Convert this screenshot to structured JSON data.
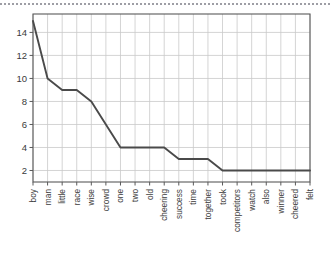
{
  "chart_data": {
    "type": "line",
    "title": "",
    "subtitle": "",
    "xlabel": "",
    "ylabel": "",
    "categories": [
      "boy",
      "man",
      "little",
      "race",
      "wise",
      "crowd",
      "one",
      "two",
      "old",
      "cheering",
      "success",
      "time",
      "together",
      "took",
      "competitors",
      "watch",
      "also",
      "winner",
      "cheered",
      "felt"
    ],
    "values": [
      15,
      10,
      9,
      9,
      8,
      6,
      4,
      4,
      4,
      4,
      3,
      3,
      3,
      2,
      2,
      2,
      2,
      2,
      2,
      2
    ],
    "series": [
      {
        "name": "word frequency",
        "values": [
          15,
          10,
          9,
          9,
          8,
          6,
          4,
          4,
          4,
          4,
          3,
          3,
          3,
          2,
          2,
          2,
          2,
          2,
          2,
          2
        ]
      }
    ],
    "ylim": [
      1,
      15.6
    ],
    "xlim": [
      0,
      19
    ],
    "yticks": [
      2,
      4,
      6,
      8,
      10,
      12,
      14
    ],
    "ytick_labels": [
      "2",
      "4",
      "6",
      "8",
      "10",
      "12",
      "14"
    ],
    "grid": true,
    "grid_axes": "both",
    "legend": "none",
    "annotations": [],
    "colors": {
      "line": "#4a4a4a",
      "grid": "#c9c9c9",
      "axis": "#5a5a5a",
      "background": "#ffffff",
      "text": "#3a3a3a"
    }
  }
}
